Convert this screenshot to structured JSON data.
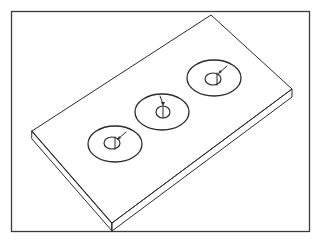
{
  "figure": {
    "colors": {
      "ink": "#2a2a2a",
      "background": "#ffffff",
      "frame": "#3a3a3a"
    },
    "frame": {
      "x": 11,
      "y": 11,
      "width": 298,
      "height": 220
    },
    "plate": {
      "top_face": [
        [
          32,
          131
        ],
        [
          211,
          15
        ],
        [
          292,
          89
        ],
        [
          112,
          223
        ]
      ],
      "thickness": 8
    },
    "features": [
      {
        "label": "hole-1",
        "outer": {
          "cx": 115,
          "cy": 144,
          "rx": 27,
          "ry": 18
        },
        "inner": {
          "cx": 112,
          "cy": 143,
          "rx": 8,
          "ry": 6
        },
        "arrow_from": [
          126,
          132
        ],
        "arrow_to": [
          118,
          139
        ]
      },
      {
        "label": "hole-2",
        "outer": {
          "cx": 162,
          "cy": 112,
          "rx": 27,
          "ry": 18
        },
        "inner": {
          "cx": 163,
          "cy": 112,
          "rx": 7,
          "ry": 6
        },
        "arrow_from": [
          160,
          96
        ],
        "arrow_to": [
          163,
          105
        ]
      },
      {
        "label": "hole-3",
        "outer": {
          "cx": 214,
          "cy": 78,
          "rx": 27,
          "ry": 18
        },
        "inner": {
          "cx": 214,
          "cy": 78,
          "rx": 8,
          "ry": 6
        },
        "arrow_from": [
          227,
          66
        ],
        "arrow_to": [
          219,
          73
        ]
      }
    ]
  }
}
